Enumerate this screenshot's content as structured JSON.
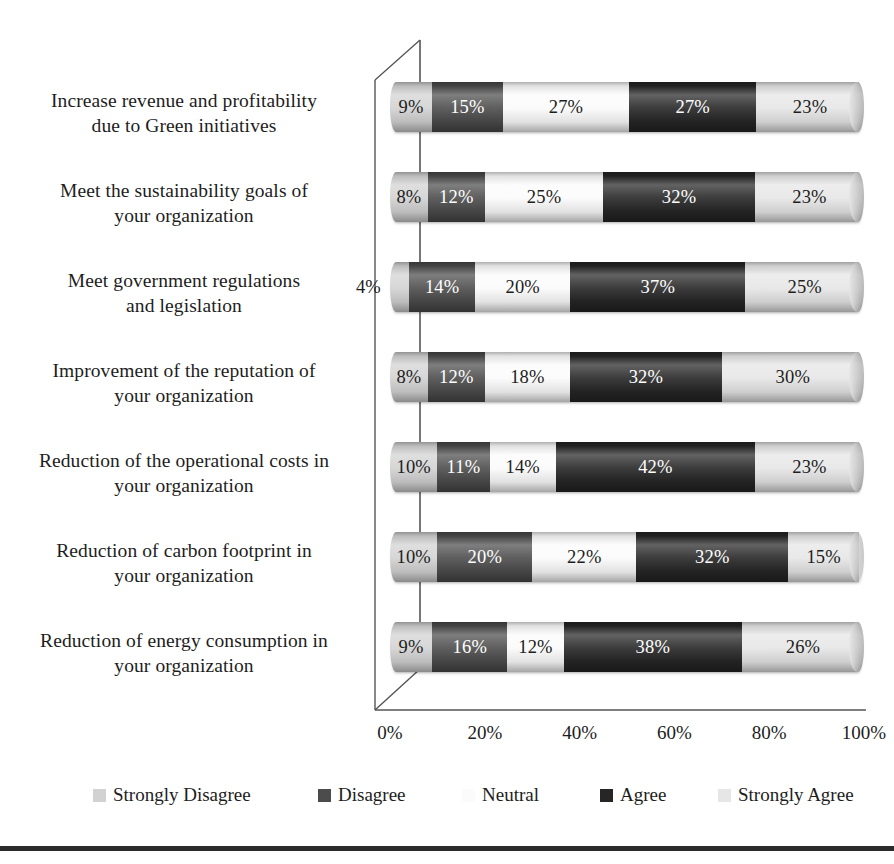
{
  "chart_data": {
    "type": "bar",
    "subtype": "stacked-horizontal-3d-cylinder",
    "title": "",
    "xlabel": "",
    "ylabel": "",
    "xlim": [
      0,
      100
    ],
    "xticks": [
      "0%",
      "20%",
      "40%",
      "60%",
      "80%",
      "100%"
    ],
    "xtick_values": [
      0,
      20,
      40,
      60,
      80,
      100
    ],
    "grid": false,
    "legend_position": "bottom",
    "stacked": true,
    "value_suffix": "%",
    "categories": [
      "Increase revenue and profitability due to Green initiatives",
      "Meet the sustainability goals of your organization",
      "Meet government regulations and legislation",
      "Improvement of the reputation of your organization",
      "Reduction of the operational costs in your organization",
      "Reduction of carbon footprint in your organization",
      "Reduction of energy consumption in your organization"
    ],
    "category_lines": [
      [
        "Increase revenue and profitability",
        "due to Green initiatives"
      ],
      [
        "Meet the sustainability goals of",
        "your organization"
      ],
      [
        "Meet government regulations",
        "and legislation"
      ],
      [
        "Improvement of the reputation of",
        "your organization"
      ],
      [
        "Reduction of the operational costs in",
        "your organization"
      ],
      [
        "Reduction of carbon footprint in",
        "your organization"
      ],
      [
        "Reduction of energy consumption in",
        "your organization"
      ]
    ],
    "series": [
      {
        "name": "Strongly Disagree",
        "color": "#d2d2d2",
        "text_color": "#1d1d1d",
        "values": [
          9,
          8,
          4,
          8,
          10,
          10,
          9
        ]
      },
      {
        "name": "Disagree",
        "color": "#4c4c4c",
        "text_color": "#ffffff",
        "values": [
          15,
          12,
          14,
          12,
          11,
          20,
          16
        ]
      },
      {
        "name": "Neutral",
        "color": "#fbfbfb",
        "text_color": "#1d1d1d",
        "values": [
          27,
          25,
          20,
          18,
          14,
          22,
          12
        ]
      },
      {
        "name": "Agree",
        "color": "#262626",
        "text_color": "#ffffff",
        "values": [
          27,
          32,
          37,
          32,
          42,
          32,
          38
        ]
      },
      {
        "name": "Strongly Agree",
        "color": "#e6e6e6",
        "text_color": "#1d1d1d",
        "values": [
          23,
          23,
          25,
          30,
          23,
          15,
          26
        ]
      }
    ],
    "labels": [
      [
        "9%",
        "15%",
        "27%",
        "27%",
        "23%"
      ],
      [
        "8%",
        "12%",
        "25%",
        "32%",
        "23%"
      ],
      [
        "4%",
        "14%",
        "20%",
        "37%",
        "25%"
      ],
      [
        "8%",
        "12%",
        "18%",
        "32%",
        "30%"
      ],
      [
        "10%",
        "11%",
        "14%",
        "42%",
        "23%"
      ],
      [
        "10%",
        "20%",
        "22%",
        "32%",
        "15%"
      ],
      [
        "9%",
        "16%",
        "12%",
        "38%",
        "26%"
      ]
    ]
  },
  "legend": {
    "items": [
      {
        "label": "Strongly Disagree",
        "color": "#d2d2d2",
        "left": 93
      },
      {
        "label": "Disagree",
        "color": "#4c4c4c",
        "left": 318
      },
      {
        "label": "Neutral",
        "color": "#fbfbfb",
        "left": 462
      },
      {
        "label": "Agree",
        "color": "#262626",
        "left": 600
      },
      {
        "label": "Strongly Agree",
        "color": "#e6e6e6",
        "left": 718
      }
    ]
  },
  "axis": {
    "frame_color": "#555555",
    "bottom_rule_color": "#2b2b2b"
  }
}
